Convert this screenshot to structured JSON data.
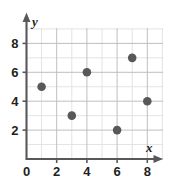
{
  "chart_data": {
    "type": "scatter",
    "title": "",
    "xlabel": "x",
    "ylabel": "y",
    "xlim": [
      0,
      10
    ],
    "ylim": [
      0,
      10
    ],
    "xticks": [
      0,
      2,
      4,
      6,
      8
    ],
    "yticks": [
      0,
      2,
      4,
      6,
      8
    ],
    "xtick_labels": [
      "0",
      "2",
      "4",
      "6",
      "8"
    ],
    "ytick_labels": [
      "0",
      "2",
      "4",
      "6",
      "8"
    ],
    "grid": true,
    "grid_step": 1,
    "legend": "none",
    "marker": "filled-circle",
    "marker_color": "#58585b",
    "points": [
      {
        "x": 1,
        "y": 5
      },
      {
        "x": 3,
        "y": 3
      },
      {
        "x": 4,
        "y": 6
      },
      {
        "x": 6,
        "y": 2
      },
      {
        "x": 7,
        "y": 7
      },
      {
        "x": 8,
        "y": 4
      }
    ],
    "series": [
      {
        "name": "",
        "x": [
          1,
          3,
          4,
          6,
          7,
          8
        ],
        "values": [
          5,
          3,
          6,
          2,
          7,
          4
        ]
      }
    ]
  },
  "axes": {
    "x_name": "x",
    "y_name": "y",
    "origin_label": "0"
  },
  "colors": {
    "grid_minor": "#e3e3e5",
    "grid_major": "#bfbfc2",
    "axis": "#58585b",
    "marker": "#58585b",
    "text": "#231f20",
    "background": "#ffffff"
  }
}
